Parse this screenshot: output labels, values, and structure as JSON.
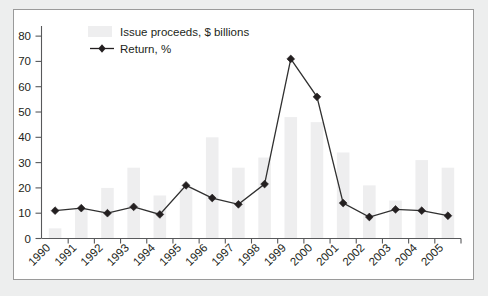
{
  "figure": {
    "background_color": "#edeeee",
    "card_color": "#ffffff",
    "border_color": "#9a9a9a"
  },
  "legend": {
    "position": "top-left-inside",
    "entries": [
      {
        "label": "Issue proceeds, $ billions",
        "marker": "swatch",
        "color": "#eeeeef"
      },
      {
        "label": "Return, %",
        "marker": "line-diamond",
        "color": "#231f20"
      }
    ]
  },
  "axis": {
    "y_ticks": [
      "80",
      "70",
      "60",
      "50",
      "40",
      "30",
      "20",
      "10",
      "0"
    ],
    "y_tick_values": [
      80,
      70,
      60,
      50,
      40,
      30,
      20,
      10,
      0
    ],
    "x_ticks": [
      "1990",
      "1991",
      "1992",
      "1993",
      "1994",
      "1995",
      "1996",
      "1997",
      "1998",
      "1999",
      "2000",
      "2001",
      "2002",
      "2003",
      "2004",
      "2005"
    ]
  },
  "chart_data": {
    "type": "bar",
    "title": "",
    "subtitle": "",
    "xlabel": "",
    "ylabel": "",
    "ylim": [
      0,
      84
    ],
    "grid": false,
    "legend_position": "top-left inside plot area",
    "categories": [
      "1990",
      "1991",
      "1992",
      "1993",
      "1994",
      "1995",
      "1996",
      "1997",
      "1998",
      "1999",
      "2000",
      "2001",
      "2002",
      "2003",
      "2004",
      "2005"
    ],
    "series": [
      {
        "name": "Issue proceeds, $ billions",
        "type": "bar",
        "color": "#eeeeef",
        "values": [
          4,
          12,
          20,
          28,
          17,
          20,
          40,
          28,
          32,
          48,
          46,
          34,
          21,
          15,
          31,
          28
        ]
      },
      {
        "name": "Return, %",
        "type": "line",
        "color": "#231f20",
        "marker": "diamond",
        "values": [
          11,
          12,
          10,
          12.5,
          9.5,
          21,
          16,
          13.5,
          21.5,
          71,
          56,
          14,
          8.5,
          11.5,
          11,
          9
        ]
      }
    ]
  }
}
